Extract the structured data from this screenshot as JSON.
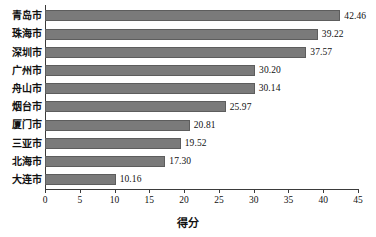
{
  "chart_data": {
    "type": "bar",
    "orientation": "horizontal",
    "title": "",
    "xlabel": "得分",
    "ylabel": "",
    "xlim": [
      0,
      45
    ],
    "xticks": [
      0,
      5,
      10,
      15,
      20,
      25,
      30,
      35,
      40,
      45
    ],
    "grid": false,
    "legend": false,
    "bar_color": "#7a7a7a",
    "bar_edge_color": "#5d5d5d",
    "background_color": "#ffffff",
    "categories": [
      "青岛市",
      "珠海市",
      "深圳市",
      "广州市",
      "舟山市",
      "烟台市",
      "厦门市",
      "三亚市",
      "北海市",
      "大连市"
    ],
    "values": [
      42.46,
      39.22,
      37.57,
      30.2,
      30.14,
      25.97,
      20.81,
      19.52,
      17.3,
      10.16
    ],
    "value_labels": [
      "42.46",
      "39.22",
      "37.57",
      "30.20",
      "30.14",
      "25.97",
      "20.81",
      "19.52",
      "17.30",
      "10.16"
    ]
  }
}
